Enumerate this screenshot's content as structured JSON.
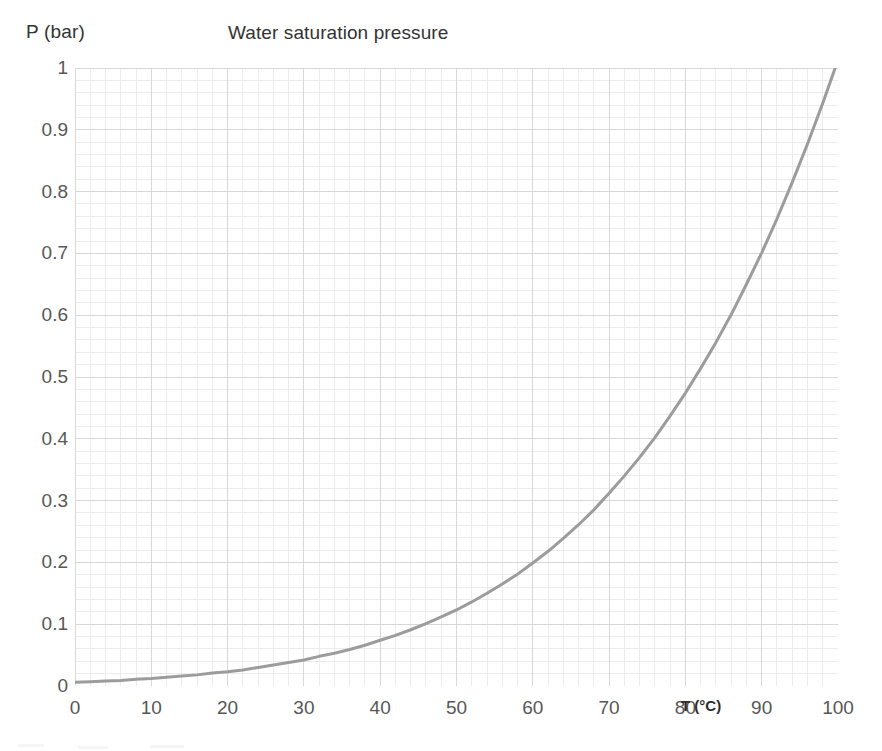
{
  "chart_data": {
    "type": "line",
    "title": "Water saturation pressure",
    "xlabel": "T (°C)",
    "ylabel": "P (bar)",
    "xlim": [
      0,
      100
    ],
    "ylim": [
      0,
      1
    ],
    "xticks": [
      "0",
      "10",
      "20",
      "30",
      "40",
      "50",
      "60",
      "70",
      "80",
      "90",
      "100"
    ],
    "xtick_values": [
      0,
      10,
      20,
      30,
      40,
      50,
      60,
      70,
      80,
      90,
      100
    ],
    "yticks": [
      "0",
      "0.1",
      "0.2",
      "0.3",
      "0.4",
      "0.5",
      "0.6",
      "0.7",
      "0.8",
      "0.9",
      "1"
    ],
    "ytick_values": [
      0,
      0.1,
      0.2,
      0.3,
      0.4,
      0.5,
      0.6,
      0.7,
      0.8,
      0.9,
      1
    ],
    "grid": true,
    "grid_minor": true,
    "legend": null,
    "legend_position": "none",
    "series": [
      {
        "name": "Water saturation pressure",
        "color": "#9c9c9c",
        "x": [
          0,
          2,
          4,
          6,
          8,
          10,
          12,
          14,
          16,
          18,
          20,
          22,
          24,
          26,
          28,
          30,
          32,
          34,
          36,
          38,
          40,
          42,
          44,
          46,
          48,
          50,
          52,
          54,
          56,
          58,
          60,
          62,
          64,
          66,
          68,
          70,
          72,
          74,
          76,
          78,
          80,
          82,
          84,
          86,
          88,
          90,
          92,
          94,
          96,
          98,
          100
        ],
        "values": [
          0.006,
          0.007,
          0.008,
          0.009,
          0.011,
          0.012,
          0.014,
          0.016,
          0.018,
          0.021,
          0.023,
          0.026,
          0.03,
          0.034,
          0.038,
          0.042,
          0.048,
          0.053,
          0.059,
          0.066,
          0.074,
          0.082,
          0.091,
          0.101,
          0.112,
          0.123,
          0.136,
          0.15,
          0.165,
          0.181,
          0.199,
          0.218,
          0.239,
          0.261,
          0.285,
          0.312,
          0.34,
          0.37,
          0.402,
          0.437,
          0.474,
          0.514,
          0.556,
          0.601,
          0.65,
          0.701,
          0.756,
          0.815,
          0.877,
          0.943,
          1.013
        ]
      }
    ]
  },
  "axis_captions": {
    "y_caption": "P (bar)",
    "x_caption": "T (°C)"
  },
  "colors": {
    "curve": "#9c9c9c",
    "grid_major": "#d8d8d8",
    "grid_minor": "#ececec",
    "text": "#575757",
    "title_text": "#333333"
  }
}
